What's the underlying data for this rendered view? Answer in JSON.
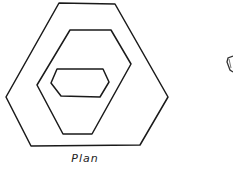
{
  "figure": {
    "caption": "Plan",
    "stroke_color": "#1a1a1a",
    "shapes": [
      {
        "name": "outer-hexagon",
        "points": "59,3 115,4 168,97 140,145 31,146 6,97"
      },
      {
        "name": "middle-hexagon",
        "points": "70,30 111,30 131,64 92,134 63,134 37,85"
      },
      {
        "name": "inner-hexagon",
        "points": "57,69 103,69 109,82 100,97 61,96 51,83"
      }
    ],
    "partial_fragment": {
      "name": "cropped-second-view-fragment",
      "points": "233,56 228,58 227,62 230,70 233,72"
    }
  }
}
